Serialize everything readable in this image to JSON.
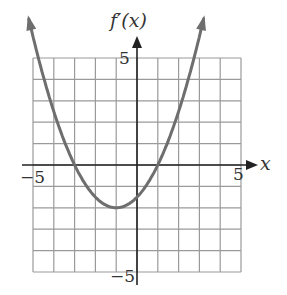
{
  "chart_data": {
    "type": "line",
    "xlabel": "x",
    "ylabel": "f'(x)",
    "xlim": [
      -5,
      5
    ],
    "ylim": [
      -5,
      5
    ],
    "grid": true,
    "x_ticks_labeled": [
      -5,
      5
    ],
    "y_ticks_labeled": [
      5,
      -5
    ],
    "series": [
      {
        "name": "f'(x)",
        "description": "Upward-opening parabola with x-intercepts at -3 and 1, minimum near (-1, -2)",
        "x": [
          -5.2,
          -5,
          -4,
          -3,
          -2,
          -1,
          0,
          1,
          2,
          3,
          3.2
        ],
        "values": [
          6.72,
          6,
          2.5,
          0,
          -1.5,
          -2,
          -1.5,
          0,
          2.5,
          6,
          6.72
        ]
      }
    ]
  },
  "labels": {
    "y_axis": "f′(x)",
    "x_axis": "x",
    "x_min": "−5",
    "x_max": "5",
    "y_max": "5",
    "y_min": "−5"
  },
  "colors": {
    "grid": "#9a9a9a",
    "axis": "#222222",
    "curve": "#6e6e6e"
  }
}
